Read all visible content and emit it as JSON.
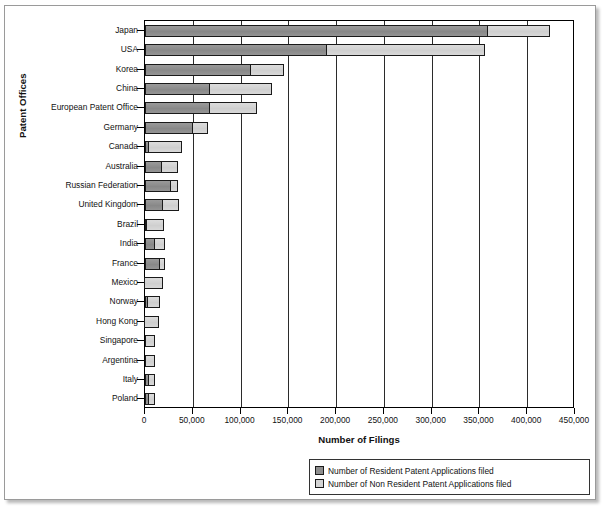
{
  "chart_data": {
    "type": "bar",
    "orientation": "horizontal",
    "stacked": true,
    "title": "",
    "xlabel": "Number of Filings",
    "ylabel": "Patent Offices",
    "xlim": [
      0,
      450000
    ],
    "xticks": [
      0,
      50000,
      100000,
      150000,
      200000,
      250000,
      300000,
      350000,
      400000,
      450000
    ],
    "xtick_labels": [
      "0",
      "50,000",
      "100,000",
      "150,000",
      "200,000",
      "250,000",
      "300,000",
      "350,000",
      "400,000",
      "450,000"
    ],
    "grid": true,
    "legend_position": "bottom-right",
    "categories": [
      "Japan",
      "USA",
      "Korea",
      "China",
      "European Patent Office",
      "Germany",
      "Canada",
      "Australia",
      "Russian Federation",
      "United Kingdom",
      "Brazil",
      "India",
      "France",
      "Mexico",
      "Norway",
      "Hong Kong",
      "Singapore",
      "Argentina",
      "Italy",
      "Poland"
    ],
    "series": [
      {
        "name": "Number of Resident Patent Applications filed",
        "color": "#8e8e8e",
        "values": [
          358600,
          190600,
          111200,
          67500,
          68200,
          50000,
          4500,
          17500,
          27300,
          18600,
          1800,
          10200,
          16100,
          500,
          3100,
          300,
          700,
          700,
          4500,
          4000
        ]
      },
      {
        "name": "Number of Non Resident Patent Applications filed",
        "color": "#d4d4d4",
        "values": [
          65400,
          164800,
          33900,
          65000,
          49300,
          15700,
          34000,
          16800,
          7000,
          17000,
          18500,
          10300,
          5200,
          18000,
          12900,
          14700,
          9500,
          10100,
          6000,
          6800
        ]
      }
    ],
    "totals": [
      424000,
      355400,
      145100,
      132500,
      117500,
      65700,
      38500,
      34300,
      34300,
      35600,
      20300,
      20500,
      21300,
      18500,
      16000,
      15000,
      10200,
      10800,
      10500,
      10800
    ]
  },
  "legend": {
    "items": [
      {
        "label": "Number of Resident Patent Applications filed",
        "color": "#8e8e8e"
      },
      {
        "label": "Number of Non Resident Patent Applications filed",
        "color": "#d4d4d4"
      }
    ]
  }
}
